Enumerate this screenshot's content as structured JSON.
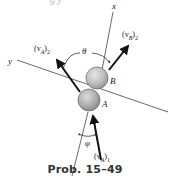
{
  "top_text_fragment": "g y",
  "axes": {
    "x_label": "x",
    "y_label": "y"
  },
  "bodies": [
    {
      "name": "B",
      "label": "B",
      "color": "#b8b8b8"
    },
    {
      "name": "A",
      "label": "A",
      "color": "#a8a8a8"
    }
  ],
  "vectors": {
    "vA2": {
      "main": "(v",
      "sub": "A",
      "close": ")",
      "idx": "2"
    },
    "vB2": {
      "main": "(v",
      "sub": "B",
      "close": ")",
      "idx": "2"
    },
    "vA1": {
      "main": "(v",
      "sub": "A",
      "close": ")",
      "idx": "1"
    }
  },
  "angles": {
    "theta": "θ",
    "phi": "φ"
  },
  "caption": "Prob. 15–49",
  "colors": {
    "line": "#333333",
    "arrow": "#111111",
    "ball_edge": "#666666"
  }
}
